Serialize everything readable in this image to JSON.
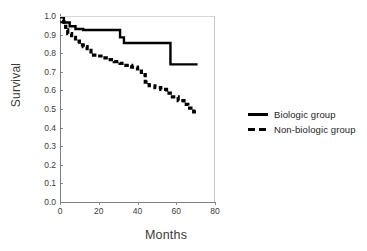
{
  "chart_data": {
    "type": "line",
    "title": "",
    "xlabel": "Months",
    "ylabel": "Survival",
    "xlim": [
      0,
      80
    ],
    "ylim": [
      0,
      1.0
    ],
    "xticks": [
      0,
      20,
      40,
      60,
      80
    ],
    "yticks": [
      "0.0",
      "0.1",
      "0.2",
      "0.3",
      "0.4",
      "0.5",
      "0.6",
      "0.7",
      "0.8",
      "0.9",
      "1.0"
    ],
    "grid": false,
    "legend_position": "right",
    "legend": [
      {
        "label": "Biologic group",
        "style": "solid"
      },
      {
        "label": "Non-biologic group",
        "style": "dashed"
      }
    ],
    "series": [
      {
        "name": "Biologic group",
        "style": "solid",
        "color": "#000000",
        "steps": true,
        "points": [
          [
            0,
            1.0
          ],
          [
            2,
            1.0
          ],
          [
            2,
            0.965
          ],
          [
            5,
            0.965
          ],
          [
            5,
            0.945
          ],
          [
            8,
            0.945
          ],
          [
            8,
            0.93
          ],
          [
            12,
            0.93
          ],
          [
            12,
            0.925
          ],
          [
            31,
            0.925
          ],
          [
            31,
            0.885
          ],
          [
            33,
            0.885
          ],
          [
            33,
            0.855
          ],
          [
            57,
            0.855
          ],
          [
            57,
            0.74
          ],
          [
            71,
            0.74
          ]
        ]
      },
      {
        "name": "Non-biologic group",
        "style": "dashed",
        "color": "#000000",
        "steps": true,
        "points": [
          [
            0,
            1.0
          ],
          [
            1,
            1.0
          ],
          [
            1,
            0.97
          ],
          [
            2,
            0.97
          ],
          [
            2,
            0.945
          ],
          [
            3,
            0.945
          ],
          [
            3,
            0.925
          ],
          [
            4,
            0.925
          ],
          [
            4,
            0.905
          ],
          [
            6,
            0.905
          ],
          [
            6,
            0.885
          ],
          [
            8,
            0.885
          ],
          [
            8,
            0.865
          ],
          [
            10,
            0.865
          ],
          [
            10,
            0.845
          ],
          [
            12,
            0.845
          ],
          [
            12,
            0.835
          ],
          [
            14,
            0.835
          ],
          [
            14,
            0.815
          ],
          [
            16,
            0.815
          ],
          [
            16,
            0.79
          ],
          [
            19,
            0.79
          ],
          [
            19,
            0.785
          ],
          [
            22,
            0.785
          ],
          [
            22,
            0.775
          ],
          [
            25,
            0.775
          ],
          [
            25,
            0.765
          ],
          [
            28,
            0.765
          ],
          [
            28,
            0.755
          ],
          [
            31,
            0.755
          ],
          [
            31,
            0.745
          ],
          [
            34,
            0.745
          ],
          [
            34,
            0.735
          ],
          [
            37,
            0.735
          ],
          [
            37,
            0.725
          ],
          [
            40,
            0.725
          ],
          [
            40,
            0.715
          ],
          [
            42,
            0.715
          ],
          [
            42,
            0.685
          ],
          [
            44,
            0.685
          ],
          [
            44,
            0.645
          ],
          [
            46,
            0.645
          ],
          [
            46,
            0.625
          ],
          [
            49,
            0.625
          ],
          [
            49,
            0.615
          ],
          [
            52,
            0.615
          ],
          [
            52,
            0.605
          ],
          [
            55,
            0.605
          ],
          [
            55,
            0.585
          ],
          [
            58,
            0.585
          ],
          [
            58,
            0.565
          ],
          [
            61,
            0.565
          ],
          [
            61,
            0.545
          ],
          [
            64,
            0.545
          ],
          [
            64,
            0.525
          ],
          [
            66,
            0.525
          ],
          [
            66,
            0.505
          ],
          [
            69,
            0.505
          ],
          [
            69,
            0.485
          ],
          [
            71,
            0.485
          ]
        ]
      }
    ]
  }
}
